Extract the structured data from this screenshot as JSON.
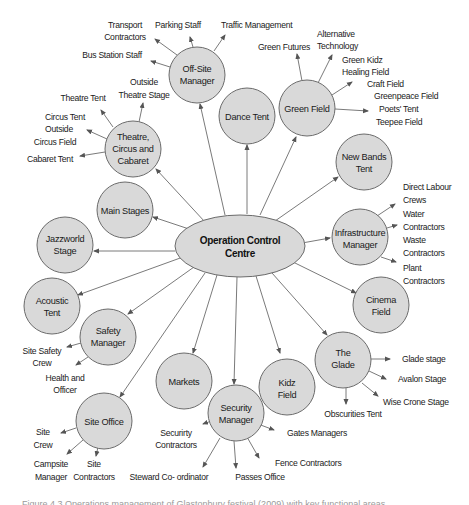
{
  "diagram": {
    "colors": {
      "node_fill": "#d9d9d9",
      "node_stroke": "#6b6b6b",
      "edge": "#6b6b6b",
      "text": "#1a1a1a",
      "caption": "#9a9a9a"
    },
    "central": {
      "id": "operation-control-centre",
      "lines": [
        "Operation Control",
        "Centre"
      ]
    },
    "nodes": [
      {
        "id": "off-site-manager",
        "lines": [
          "Off-Site",
          "Manager"
        ],
        "children": [
          {
            "lines": [
              "Transport",
              "Contractors"
            ]
          },
          {
            "lines": [
              "Parking Staff"
            ]
          },
          {
            "lines": [
              "Traffic Management"
            ]
          },
          {
            "lines": [
              "Bus Station Staff"
            ]
          }
        ]
      },
      {
        "id": "dance-tent",
        "lines": [
          "Dance Tent"
        ],
        "children": []
      },
      {
        "id": "green-field",
        "lines": [
          "Green Field"
        ],
        "children": [
          {
            "lines": [
              "Green Futures"
            ]
          },
          {
            "lines": [
              "Alternative",
              "Technology"
            ]
          },
          {
            "lines": [
              "Green Kidz",
              "Healing Field"
            ]
          },
          {
            "lines": [
              "Craft Field",
              "Greenpeace Field",
              "Poets' Tent",
              "Teepee Field"
            ]
          }
        ]
      },
      {
        "id": "new-bands-tent",
        "lines": [
          "New Bands",
          "Tent"
        ],
        "children": []
      },
      {
        "id": "infrastructure-manager",
        "lines": [
          "Infrastructure",
          "Manager"
        ],
        "children": [
          {
            "lines": [
              "Direct Labour",
              "Crews"
            ]
          },
          {
            "lines": [
              "Water",
              "Contractors"
            ]
          },
          {
            "lines": [
              "Waste",
              "Contractors"
            ]
          },
          {
            "lines": [
              "Plant",
              "Contractors"
            ]
          }
        ]
      },
      {
        "id": "cinema-field",
        "lines": [
          "Cinema",
          "Field"
        ],
        "children": []
      },
      {
        "id": "the-glade",
        "lines": [
          "The",
          "Glade"
        ],
        "children": [
          {
            "lines": [
              "Glade stage"
            ]
          },
          {
            "lines": [
              "Avalon Stage"
            ]
          },
          {
            "lines": [
              "Wise Crone Stage"
            ]
          },
          {
            "lines": [
              "Obscurities Tent"
            ]
          }
        ]
      },
      {
        "id": "kidz-field",
        "lines": [
          "Kidz",
          "Field"
        ],
        "children": []
      },
      {
        "id": "security-manager",
        "lines": [
          "Security",
          "Manager"
        ],
        "children": [
          {
            "lines": [
              "Securirty",
              "Contractors"
            ]
          },
          {
            "lines": [
              "Gates Managers"
            ]
          },
          {
            "lines": [
              "Fence Contractors"
            ]
          },
          {
            "lines": [
              "Passes Office"
            ]
          },
          {
            "lines": [
              "Steward Co- ordinator"
            ]
          }
        ]
      },
      {
        "id": "markets",
        "lines": [
          "Markets"
        ],
        "children": []
      },
      {
        "id": "site-office",
        "lines": [
          "Site Office"
        ],
        "children": [
          {
            "lines": [
              "Site",
              "Crew"
            ]
          },
          {
            "lines": [
              "Campsite",
              "Manager"
            ]
          },
          {
            "lines": [
              "Site",
              "Contractors"
            ]
          }
        ]
      },
      {
        "id": "safety-manager",
        "lines": [
          "Safety",
          "Manager"
        ],
        "children": [
          {
            "lines": [
              "Site Safety",
              "Crew"
            ]
          },
          {
            "lines": [
              "Health and",
              "Officer"
            ]
          }
        ]
      },
      {
        "id": "acoustic-tent",
        "lines": [
          "Acoustic",
          "Tent"
        ],
        "children": []
      },
      {
        "id": "jazzworld-stage",
        "lines": [
          "Jazzworld",
          "Stage"
        ],
        "children": []
      },
      {
        "id": "main-stages",
        "lines": [
          "Main Stages"
        ],
        "children": []
      },
      {
        "id": "theatre-circus-cabaret",
        "lines": [
          "Theatre,",
          "Circus and",
          "Cabaret"
        ],
        "children": [
          {
            "lines": [
              "Theatre Tent"
            ]
          },
          {
            "lines": [
              "Outside",
              "Theatre Stage"
            ]
          },
          {
            "lines": [
              "Circus Tent",
              "Outside",
              "Circus Field"
            ]
          },
          {
            "lines": [
              "Cabaret Tent"
            ]
          }
        ]
      }
    ],
    "caption": "Figure 4.3   Operations management of Glastonbury festival (2009) with key functional areas"
  }
}
